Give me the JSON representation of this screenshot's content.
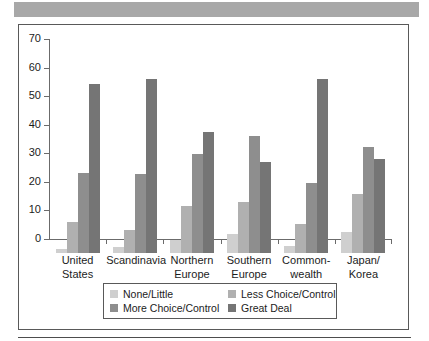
{
  "chart_data": {
    "type": "bar",
    "title": "",
    "subtitle": "",
    "xlabel": "",
    "ylabel": "",
    "ylim": [
      0,
      70
    ],
    "yticks": [
      0,
      10,
      20,
      30,
      40,
      50,
      60,
      70
    ],
    "grid": false,
    "legend_position": "bottom",
    "categories": [
      "United States",
      "Scandinavia",
      "Northern Europe",
      "Southern Europe",
      "Commonwealth",
      "Japan/Korea"
    ],
    "category_lines": [
      [
        "United",
        "States"
      ],
      [
        "Scandinavia",
        ""
      ],
      [
        "Northern",
        "Europe"
      ],
      [
        "Southern",
        "Europe"
      ],
      [
        "Common-",
        "wealth"
      ],
      [
        "Japan/",
        "Korea"
      ]
    ],
    "series": [
      {
        "name": "None/Little",
        "color": "#cfcfcf",
        "values": [
          1.5,
          2.0,
          4.5,
          6.5,
          2.5,
          7.5
        ]
      },
      {
        "name": "Less Choice/Control",
        "color": "#b0b0b0",
        "values": [
          11.0,
          8.0,
          16.5,
          18.0,
          10.0,
          20.5
        ]
      },
      {
        "name": "More Choice/Control",
        "color": "#8e8e8e",
        "values": [
          28.0,
          27.5,
          34.5,
          41.0,
          24.5,
          37.0
        ]
      },
      {
        "name": "Great Deal",
        "color": "#757575",
        "values": [
          59.0,
          61.0,
          42.5,
          32.0,
          61.0,
          33.0
        ]
      }
    ],
    "legend_order": [
      "None/Little",
      "Less Choice/Control",
      "More Choice/Control",
      "Great Deal"
    ]
  },
  "figure": {
    "header_band_color": "#a8a8a8",
    "frame_color": "#595959",
    "axis_color": "#6b6b6b",
    "rule_color": "#4d4d4d"
  }
}
